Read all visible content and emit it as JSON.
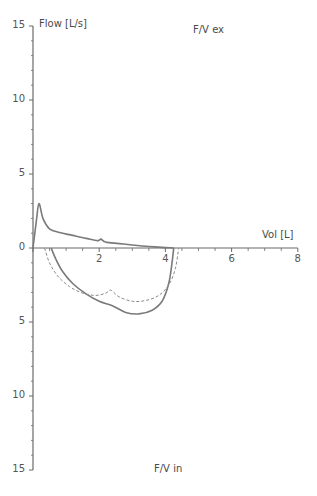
{
  "chart_data": {
    "type": "line",
    "title_top": "F/V ex",
    "title_bottom": "F/V in",
    "xlabel": "Vol [L]",
    "ylabel": "Flow [L/s]",
    "xlim": [
      0,
      8
    ],
    "ylim": [
      -15,
      15
    ],
    "x_ticks": [
      "0",
      "2",
      "4",
      "6",
      "8"
    ],
    "y_ticks_upper": [
      "15",
      "10",
      "5",
      "0"
    ],
    "y_ticks_lower": [
      "5",
      "10",
      "15"
    ],
    "grid": false,
    "series": [
      {
        "name": "Expiration (measured)",
        "style": "solid",
        "color": "#7a7a7a",
        "points": [
          [
            0.0,
            0.0
          ],
          [
            0.1,
            1.8
          ],
          [
            0.18,
            3.0
          ],
          [
            0.3,
            2.0
          ],
          [
            0.5,
            1.3
          ],
          [
            0.8,
            1.05
          ],
          [
            1.2,
            0.85
          ],
          [
            1.6,
            0.65
          ],
          [
            1.95,
            0.5
          ],
          [
            2.05,
            0.6
          ],
          [
            2.2,
            0.4
          ],
          [
            2.6,
            0.3
          ],
          [
            3.0,
            0.2
          ],
          [
            3.5,
            0.1
          ],
          [
            4.0,
            0.03
          ],
          [
            4.25,
            0.0
          ]
        ]
      },
      {
        "name": "Inspiration (measured)",
        "style": "solid",
        "color": "#7a7a7a",
        "points": [
          [
            0.55,
            0.0
          ],
          [
            0.7,
            -0.8
          ],
          [
            0.9,
            -1.6
          ],
          [
            1.2,
            -2.4
          ],
          [
            1.6,
            -3.1
          ],
          [
            2.0,
            -3.6
          ],
          [
            2.4,
            -3.9
          ],
          [
            2.8,
            -4.35
          ],
          [
            3.2,
            -4.45
          ],
          [
            3.6,
            -4.2
          ],
          [
            3.9,
            -3.6
          ],
          [
            4.1,
            -2.4
          ],
          [
            4.2,
            -1.0
          ],
          [
            4.25,
            0.0
          ]
        ]
      },
      {
        "name": "Inspiration (predicted)",
        "style": "dashed",
        "color": "#8a8a8a",
        "points": [
          [
            0.35,
            0.0
          ],
          [
            0.5,
            -1.0
          ],
          [
            0.75,
            -1.9
          ],
          [
            1.1,
            -2.6
          ],
          [
            1.5,
            -3.05
          ],
          [
            1.9,
            -3.2
          ],
          [
            2.2,
            -3.05
          ],
          [
            2.35,
            -2.85
          ],
          [
            2.6,
            -3.3
          ],
          [
            3.0,
            -3.6
          ],
          [
            3.4,
            -3.55
          ],
          [
            3.8,
            -3.2
          ],
          [
            4.1,
            -2.5
          ],
          [
            4.3,
            -1.4
          ],
          [
            4.4,
            0.0
          ]
        ]
      }
    ]
  }
}
